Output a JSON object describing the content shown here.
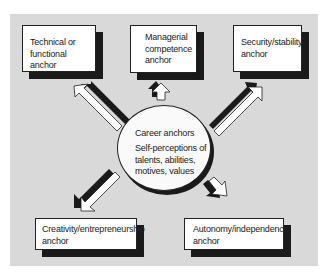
{
  "diagram": {
    "center": {
      "title": "Career anchors",
      "description_lines": [
        "Self-perceptions of",
        "talents, abilities,",
        "motives, values"
      ]
    },
    "anchors": [
      {
        "id": "technical",
        "lines": [
          "Technical or",
          "functional anchor"
        ]
      },
      {
        "id": "managerial",
        "lines": [
          "Managerial",
          "competence",
          "anchor"
        ]
      },
      {
        "id": "security",
        "lines": [
          "Security/stability",
          "anchor"
        ]
      },
      {
        "id": "creativity",
        "lines": [
          "Creativity/entrepreneurship",
          "anchor"
        ]
      },
      {
        "id": "autonomy",
        "lines": [
          "Autonomy/independence",
          "anchor"
        ]
      }
    ],
    "colors": {
      "background": "#d9d9d9",
      "box_fill": "#ffffff",
      "shadow": "#1a1a1a",
      "border": "#222222"
    }
  }
}
